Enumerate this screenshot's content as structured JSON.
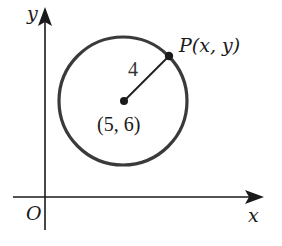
{
  "diagram": {
    "type": "coordinate-circle",
    "axes": {
      "x_label": "x",
      "y_label": "y",
      "origin_label": "O"
    },
    "circle": {
      "center_label": "(5, 6)",
      "radius_label": "4"
    },
    "point": {
      "label": "P(x, y)"
    },
    "colors": {
      "stroke": "#1a1a1a",
      "circle_stroke": "#3a3a3a",
      "background": "#ffffff"
    }
  }
}
